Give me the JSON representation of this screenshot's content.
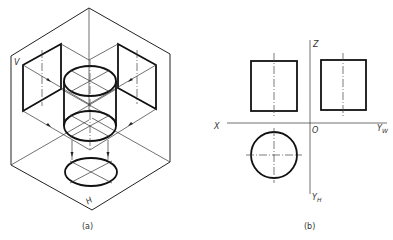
{
  "figure_a": {
    "caption": "(a)",
    "plane_labels": {
      "v": "V",
      "h": "H"
    },
    "description": "Isometric view of a cylinder inside a three-projection-plane system, with projections onto V, W, and H planes"
  },
  "figure_b": {
    "caption": "(b)",
    "axis_labels": {
      "x": "X",
      "z": "Z",
      "origin": "O",
      "yw": "Y",
      "yw_sub": "W",
      "yh": "Y",
      "yh_sub": "H"
    },
    "description": "Orthographic three-view drawing of a cylinder: front view and side view rectangles, top view circle"
  },
  "colors": {
    "line": "#222222",
    "background": "#ffffff"
  }
}
